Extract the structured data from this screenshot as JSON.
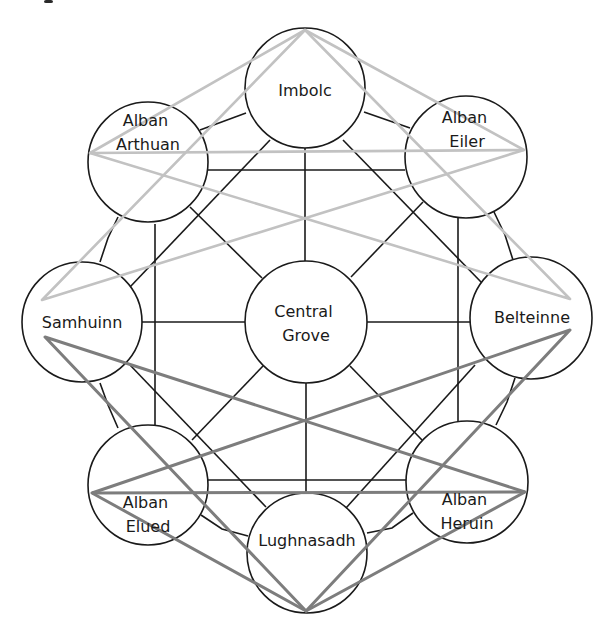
{
  "diagram": {
    "colors": {
      "outline": "#1a1a1a",
      "light_triangle": "#c2c2c2",
      "dark_triangle": "#7d7d7d",
      "background": "#ffffff"
    },
    "nodes": [
      {
        "id": "imbolc",
        "label_lines": [
          "Imbolc"
        ],
        "cx": 305,
        "cy": 88,
        "r": 60
      },
      {
        "id": "alban-arthuan",
        "label_lines": [
          "Alban",
          "Arthuan"
        ],
        "cx": 148,
        "cy": 162,
        "r": 60
      },
      {
        "id": "alban-eiler",
        "label_lines": [
          "Alban",
          "Eiler"
        ],
        "cx": 466,
        "cy": 157,
        "r": 61
      },
      {
        "id": "samhuinn",
        "label_lines": [
          "Samhuinn"
        ],
        "cx": 82,
        "cy": 322,
        "r": 60
      },
      {
        "id": "central-grove",
        "label_lines": [
          "Central",
          "Grove"
        ],
        "cx": 306,
        "cy": 322,
        "r": 61
      },
      {
        "id": "belteinne",
        "label_lines": [
          "Belteinne"
        ],
        "cx": 531,
        "cy": 318,
        "r": 61
      },
      {
        "id": "alban-elued",
        "label_lines": [
          "Alban",
          "Elued"
        ],
        "cx": 148,
        "cy": 485,
        "r": 60
      },
      {
        "id": "lughnasadh",
        "label_lines": [
          "Lughnasadh"
        ],
        "cx": 307,
        "cy": 553,
        "r": 60
      },
      {
        "id": "alban-heruin",
        "label_lines": [
          "Alban",
          "Heruin"
        ],
        "cx": 467,
        "cy": 482,
        "r": 61
      }
    ],
    "labels": {
      "imbolc": {
        "lines": [
          "Imbolc"
        ],
        "x": 305,
        "y": 96
      },
      "alban_arthuan": {
        "lines": [
          "Alban",
          "Arthuan"
        ],
        "x": 148,
        "y": 126
      },
      "alban_eiler": {
        "lines": [
          "Alban",
          "Eiler"
        ],
        "x": 467,
        "y": 123
      },
      "samhuinn": {
        "lines": [
          "Samhuinn"
        ],
        "x": 82,
        "y": 328
      },
      "central_grove": {
        "lines": [
          "Central",
          "Grove"
        ],
        "x": 306,
        "y": 317
      },
      "belteinne": {
        "lines": [
          "Belteinne"
        ],
        "x": 532,
        "y": 323
      },
      "alban_elued": {
        "lines": [
          "Alban",
          "Elued"
        ],
        "x": 148,
        "y": 508
      },
      "lughnasadh": {
        "lines": [
          "Lughnasadh"
        ],
        "x": 307,
        "y": 546
      },
      "alban_heruin": {
        "lines": [
          "Alban",
          "Heruin"
        ],
        "x": 467,
        "y": 505
      }
    },
    "connectors": [
      {
        "from": "imbolc",
        "to": "central-grove",
        "points": [
          [
            305,
            148
          ],
          [
            305,
            261
          ]
        ]
      },
      {
        "from": "alban-arthuan",
        "to": "alban-eiler",
        "points": [
          [
            208,
            170
          ],
          [
            405,
            170
          ]
        ]
      },
      {
        "from": "alban-arthuan",
        "to": "alban-elued",
        "points": [
          [
            155,
            224
          ],
          [
            155,
            425
          ]
        ]
      },
      {
        "from": "alban-eiler",
        "to": "alban-heruin",
        "points": [
          [
            458,
            218
          ],
          [
            458,
            421
          ]
        ]
      },
      {
        "from": "samhuinn",
        "to": "central-grove",
        "points": [
          [
            142,
            322
          ],
          [
            245,
            322
          ]
        ]
      },
      {
        "from": "central-grove",
        "to": "belteinne",
        "points": [
          [
            367,
            322
          ],
          [
            470,
            322
          ]
        ]
      },
      {
        "from": "central-grove",
        "to": "lughnasadh",
        "points": [
          [
            306,
            383
          ],
          [
            306,
            493
          ]
        ]
      },
      {
        "from": "alban-elued",
        "to": "alban-heruin",
        "points": [
          [
            208,
            480
          ],
          [
            406,
            480
          ]
        ]
      },
      {
        "from": "imbolc",
        "to": "alban-arthuan",
        "points": [
          [
            246,
            113
          ],
          [
            200,
            130
          ]
        ]
      },
      {
        "from": "imbolc",
        "to": "alban-eiler",
        "points": [
          [
            364,
            112
          ],
          [
            410,
            128
          ]
        ]
      },
      {
        "from": "imbolc",
        "to": "samhuinn",
        "points": [
          [
            270,
            140
          ],
          [
            130,
            287
          ]
        ]
      },
      {
        "from": "imbolc",
        "to": "belteinne",
        "points": [
          [
            343,
            140
          ],
          [
            482,
            283
          ]
        ]
      },
      {
        "from": "alban-arthuan",
        "to": "central-grove",
        "points": [
          [
            190,
            207
          ],
          [
            262,
            278
          ]
        ]
      },
      {
        "from": "alban-eiler",
        "to": "central-grove",
        "points": [
          [
            423,
            202
          ],
          [
            351,
            277
          ]
        ]
      },
      {
        "from": "alban-arthuan",
        "to": "samhuinn",
        "points": [
          [
            118,
            217
          ],
          [
            108,
            238
          ],
          [
            100,
            262
          ]
        ]
      },
      {
        "from": "alban-eiler",
        "to": "belteinne",
        "points": [
          [
            494,
            212
          ],
          [
            505,
            235
          ],
          [
            513,
            260
          ]
        ]
      },
      {
        "from": "samhuinn",
        "to": "lughnasadh",
        "points": [
          [
            130,
            365
          ],
          [
            266,
            507
          ]
        ]
      },
      {
        "from": "belteinne",
        "to": "lughnasadh",
        "points": [
          [
            475,
            365
          ],
          [
            346,
            508
          ]
        ]
      },
      {
        "from": "central-grove",
        "to": "alban-elued",
        "points": [
          [
            263,
            366
          ],
          [
            192,
            440
          ]
        ]
      },
      {
        "from": "central-grove",
        "to": "alban-heruin",
        "points": [
          [
            350,
            366
          ],
          [
            422,
            440
          ]
        ]
      },
      {
        "from": "samhuinn",
        "to": "alban-elued",
        "points": [
          [
            100,
            383
          ],
          [
            108,
            405
          ],
          [
            118,
            428
          ]
        ]
      },
      {
        "from": "belteinne",
        "to": "alban-heruin",
        "points": [
          [
            515,
            378
          ],
          [
            507,
            402
          ],
          [
            496,
            425
          ]
        ]
      },
      {
        "from": "alban-elued",
        "to": "lughnasadh",
        "points": [
          [
            201,
            515
          ],
          [
            222,
            529
          ],
          [
            248,
            536
          ]
        ]
      },
      {
        "from": "alban-heruin",
        "to": "lughnasadh",
        "points": [
          [
            413,
            513
          ],
          [
            392,
            528
          ],
          [
            367,
            533
          ]
        ]
      }
    ],
    "triangles": {
      "light": [
        {
          "name": "light-triangle-a",
          "points": [
            [
              305,
              30
            ],
            [
              570,
              299
            ],
            [
              90,
              153
            ]
          ]
        },
        {
          "name": "light-triangle-b",
          "points": [
            [
              305,
              30
            ],
            [
              42,
              300
            ],
            [
              524,
              150
            ]
          ]
        },
        {
          "name": "light-connector-arthuan-eiler",
          "points": [
            [
              90,
              153
            ],
            [
              524,
              150
            ]
          ]
        }
      ],
      "dark": [
        {
          "name": "dark-triangle-a",
          "points": [
            [
              306,
              611
            ],
            [
              45,
              337
            ],
            [
              525,
              492
            ]
          ]
        },
        {
          "name": "dark-triangle-b",
          "points": [
            [
              306,
              611
            ],
            [
              570,
              330
            ],
            [
              92,
              493
            ]
          ]
        },
        {
          "name": "dark-connector-elued-heruin",
          "points": [
            [
              92,
              493
            ],
            [
              525,
              492
            ]
          ]
        }
      ]
    },
    "cropped_glyph": {
      "x": 44,
      "y": 0,
      "w": 9,
      "h": 3
    }
  }
}
